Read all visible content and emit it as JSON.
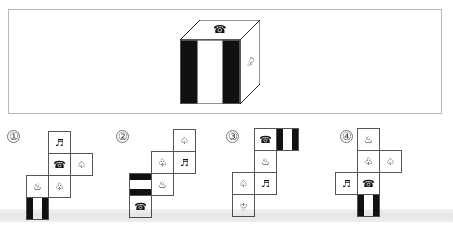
{
  "question": {
    "cube": {
      "top_symbol": "☎",
      "top_symbol_name": "telephone",
      "front_pattern": "vertical-stripes",
      "right_symbol": "♤",
      "right_symbol_name": "spade"
    }
  },
  "options": [
    {
      "label": "①",
      "cells": [
        {
          "symbol": "♬",
          "name": "music-note"
        },
        {
          "symbol": "☎",
          "name": "telephone"
        },
        {
          "symbol": "♤",
          "name": "spade"
        },
        {
          "symbol": "♨",
          "name": "fountain"
        },
        {
          "symbol": "♧",
          "name": "club"
        },
        {
          "symbol": "",
          "name": "stripes-vertical"
        }
      ]
    },
    {
      "label": "②",
      "cells": [
        {
          "symbol": "♤",
          "name": "spade"
        },
        {
          "symbol": "♧",
          "name": "club"
        },
        {
          "symbol": "♬",
          "name": "music-note"
        },
        {
          "symbol": "",
          "name": "stripes-horizontal"
        },
        {
          "symbol": "♨",
          "name": "fountain"
        },
        {
          "symbol": "☎",
          "name": "telephone"
        }
      ]
    },
    {
      "label": "③",
      "cells": [
        {
          "symbol": "☎",
          "name": "telephone"
        },
        {
          "symbol": "",
          "name": "stripes-vertical"
        },
        {
          "symbol": "♨",
          "name": "fountain"
        },
        {
          "symbol": "♤",
          "name": "spade"
        },
        {
          "symbol": "♬",
          "name": "music-note"
        },
        {
          "symbol": "♧",
          "name": "club-inverted"
        }
      ]
    },
    {
      "label": "④",
      "cells": [
        {
          "symbol": "♨",
          "name": "fountain"
        },
        {
          "symbol": "♧",
          "name": "club"
        },
        {
          "symbol": "♤",
          "name": "spade"
        },
        {
          "symbol": "♬",
          "name": "music-note"
        },
        {
          "symbol": "☎",
          "name": "telephone"
        },
        {
          "symbol": "",
          "name": "stripes-vertical"
        }
      ]
    }
  ]
}
